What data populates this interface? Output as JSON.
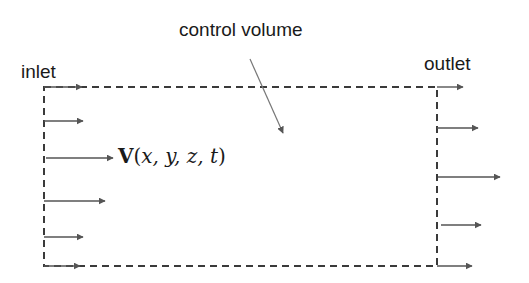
{
  "diagram": {
    "title": "control volume",
    "inlet_label": "inlet",
    "outlet_label": "outlet",
    "velocity_field": {
      "symbol": "V",
      "open": "(",
      "args": "x, y, z, t",
      "close": ")",
      "full": "V(x, y, z, t)"
    },
    "colors": {
      "boundary": "#3a3a3a",
      "arrows": "#555555",
      "text": "#1a1a1a",
      "background": "#ffffff"
    },
    "boundary": {
      "style": "dashed",
      "x": 44,
      "y": 87,
      "width": 393,
      "height": 179
    },
    "inlet_arrows": [
      {
        "y": 87,
        "x1": 44,
        "x2": 82
      },
      {
        "y": 121,
        "x1": 44,
        "x2": 83
      },
      {
        "y": 158,
        "x1": 46,
        "x2": 113
      },
      {
        "y": 201,
        "x1": 44,
        "x2": 105
      },
      {
        "y": 237,
        "x1": 44,
        "x2": 83
      },
      {
        "y": 266,
        "x1": 44,
        "x2": 80
      }
    ],
    "outlet_arrows": [
      {
        "y": 87,
        "x1": 437,
        "x2": 463
      },
      {
        "y": 128,
        "x1": 437,
        "x2": 478
      },
      {
        "y": 177,
        "x1": 438,
        "x2": 500
      },
      {
        "y": 225,
        "x1": 441,
        "x2": 481
      },
      {
        "y": 266,
        "x1": 437,
        "x2": 472
      }
    ],
    "pointer": {
      "x1": 250,
      "y1": 59,
      "x2": 283,
      "y2": 133
    }
  }
}
